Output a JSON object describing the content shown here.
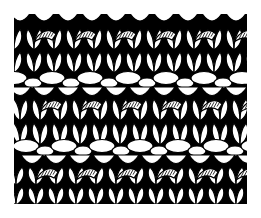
{
  "figure": {
    "style": "black and white line drawing",
    "colors": {
      "ink": "#000000",
      "paper": "#ffffff"
    },
    "bands": [
      {
        "type": "knit-vs",
        "y": 0
      },
      {
        "type": "purl-ridge",
        "y": 62
      },
      {
        "type": "knit-vs",
        "y": 70
      },
      {
        "type": "purl-ridge",
        "y": 130
      },
      {
        "type": "knit-vs",
        "y": 140
      }
    ]
  }
}
